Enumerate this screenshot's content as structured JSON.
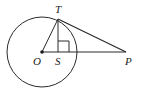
{
  "diagram": {
    "type": "geometry",
    "stroke_color": "#2a2a2a",
    "circle": {
      "center": "O",
      "cx": 42,
      "cy": 52,
      "r": 35
    },
    "points": {
      "O": {
        "label": "O",
        "x": 42,
        "y": 52
      },
      "T": {
        "label": "T",
        "x": 58,
        "y": 19
      },
      "S": {
        "label": "S",
        "x": 58,
        "y": 52
      },
      "P": {
        "label": "P",
        "x": 126,
        "y": 52
      }
    },
    "segments": [
      "OT",
      "TS",
      "OP",
      "TP"
    ],
    "right_angle_at": "S"
  }
}
